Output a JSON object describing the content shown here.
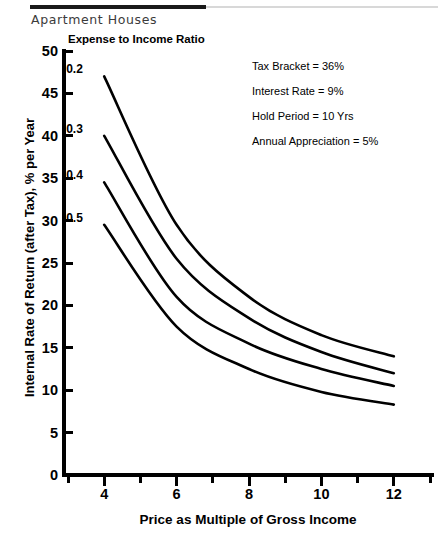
{
  "chart_title": "Apartment Houses",
  "legend_title": "Expense to Income Ratio",
  "annotations": [
    "Tax Bracket = 36%",
    "Interest Rate = 9%",
    "Hold Period = 10 Yrs",
    "Annual Appreciation = 5%"
  ],
  "axes": {
    "y_title": "Internal Rate of Return (after Tax), % per Year",
    "x_title": "Price as Multiple of Gross Income",
    "y_ticks": [
      0,
      5,
      10,
      15,
      20,
      25,
      30,
      35,
      40,
      45,
      50
    ],
    "x_major_ticks": [
      4,
      6,
      8,
      10,
      12
    ],
    "x_minor_ticks": [
      3,
      5,
      7,
      9,
      11,
      13
    ]
  },
  "chart_data": {
    "type": "line",
    "title": "Apartment Houses",
    "xlabel": "Price as Multiple of Gross Income",
    "ylabel": "Internal Rate of Return (after Tax), % per Year",
    "legend_title": "Expense to Income Ratio",
    "legend_position": "inline-left-of-curves",
    "grid": false,
    "xlim": [
      3,
      13
    ],
    "ylim": [
      0,
      50
    ],
    "x": [
      4,
      6,
      8,
      10,
      12
    ],
    "series": [
      {
        "name": "0.2",
        "values": [
          47.0,
          29.5,
          21.0,
          16.5,
          14.0
        ]
      },
      {
        "name": "0.3",
        "values": [
          40.0,
          25.5,
          18.5,
          14.5,
          12.0
        ]
      },
      {
        "name": "0.4",
        "values": [
          34.5,
          21.0,
          15.5,
          12.5,
          10.5
        ]
      },
      {
        "name": "0.5",
        "values": [
          29.5,
          17.5,
          12.5,
          9.8,
          8.3
        ]
      }
    ],
    "annotations": [
      "Tax Bracket = 36%",
      "Interest Rate = 9%",
      "Hold Period = 10 Yrs",
      "Annual Appreciation = 5%"
    ]
  },
  "colors": {
    "line": "#000000",
    "axis": "#000000",
    "title": "#3b3b3b",
    "background": "#ffffff"
  }
}
